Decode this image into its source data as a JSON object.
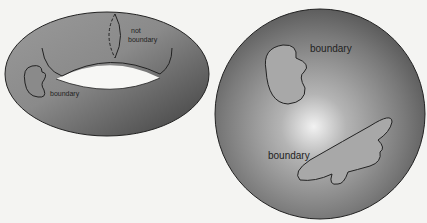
{
  "figure": {
    "torus": {
      "labels": {
        "not_boundary_line1": "not",
        "not_boundary_line2": "boundary",
        "boundary": "boundary"
      }
    },
    "sphere": {
      "labels": {
        "boundary_top": "boundary",
        "boundary_bottom": "boundary"
      }
    }
  }
}
